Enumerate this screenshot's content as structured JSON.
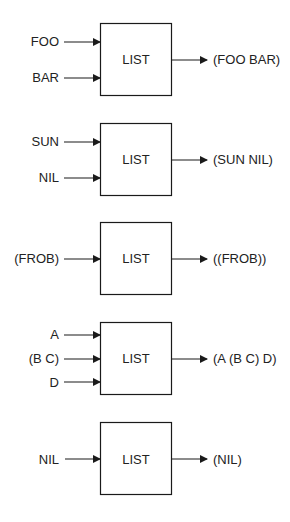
{
  "diagram": {
    "stroke_color": "#1a1a1a",
    "blocks": [
      {
        "label": "LIST",
        "inputs": [
          "FOO",
          "BAR"
        ],
        "output": "(FOO BAR)"
      },
      {
        "label": "LIST",
        "inputs": [
          "SUN",
          "NIL"
        ],
        "output": "(SUN NIL)"
      },
      {
        "label": "LIST",
        "inputs": [
          "(FROB)"
        ],
        "output": "((FROB))"
      },
      {
        "label": "LIST",
        "inputs": [
          "A",
          "(B C)",
          "D"
        ],
        "output": "(A (B C) D)"
      },
      {
        "label": "LIST",
        "inputs": [
          "NIL"
        ],
        "output": "(NIL)"
      }
    ]
  }
}
